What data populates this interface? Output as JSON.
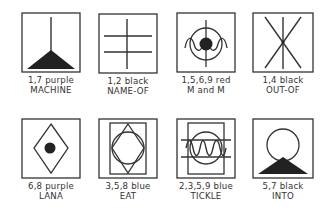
{
  "figure": {
    "symbols": [
      {
        "code": "1,7 purple",
        "name": "MACHINE",
        "icon": "machine-icon"
      },
      {
        "code": "1,2 black",
        "name": "NAME-OF",
        "icon": "name-of-icon"
      },
      {
        "code": "1,5,6,9 red",
        "name": "M and M",
        "icon": "m-and-m-icon"
      },
      {
        "code": "1,4 black",
        "name": "OUT-OF",
        "icon": "out-of-icon"
      },
      {
        "code": "6,8 purple",
        "name": "LANA",
        "icon": "lana-icon"
      },
      {
        "code": "3,5,8 blue",
        "name": "EAT",
        "icon": "eat-icon"
      },
      {
        "code": "2,3,5,9 blue",
        "name": "TICKLE",
        "icon": "tickle-icon"
      },
      {
        "code": "5,7 black",
        "name": "INTO",
        "icon": "into-icon"
      }
    ]
  }
}
